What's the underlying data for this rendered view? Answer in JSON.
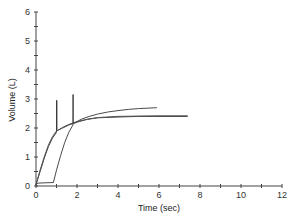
{
  "chart_data": {
    "type": "line",
    "title": "",
    "xlabel": "Time (sec)",
    "ylabel": "Volume (L)",
    "xlim": [
      0,
      12
    ],
    "ylim": [
      0,
      6
    ],
    "x_ticks": [
      0,
      2,
      4,
      6,
      8,
      10,
      12
    ],
    "y_ticks": [
      0,
      1,
      2,
      3,
      4,
      5,
      6
    ],
    "x_minor_step": 1,
    "y_minor_step": 0.5,
    "grid": false,
    "legend": null,
    "series": [
      {
        "name": "curve-1",
        "color": "#3a3a3a",
        "points": [
          [
            0,
            0.05
          ],
          [
            0.2,
            0.5
          ],
          [
            0.4,
            0.95
          ],
          [
            0.6,
            1.35
          ],
          [
            0.8,
            1.65
          ],
          [
            1.0,
            1.85
          ],
          [
            1.0,
            2.95
          ],
          [
            1.02,
            2.95
          ],
          [
            1.02,
            1.9
          ],
          [
            1.3,
            2.02
          ],
          [
            1.6,
            2.12
          ],
          [
            2.0,
            2.22
          ],
          [
            2.5,
            2.3
          ],
          [
            3,
            2.35
          ],
          [
            4,
            2.38
          ],
          [
            5,
            2.4
          ],
          [
            6,
            2.4
          ],
          [
            7.4,
            2.4
          ]
        ]
      },
      {
        "name": "curve-2",
        "color": "#555555",
        "points": [
          [
            0,
            0.05
          ],
          [
            0.2,
            0.55
          ],
          [
            0.4,
            1.0
          ],
          [
            0.6,
            1.4
          ],
          [
            0.8,
            1.7
          ],
          [
            1.0,
            1.9
          ],
          [
            1.3,
            2.0
          ],
          [
            1.6,
            2.1
          ],
          [
            2.0,
            2.2
          ],
          [
            2.5,
            2.3
          ],
          [
            3,
            2.36
          ],
          [
            4,
            2.4
          ],
          [
            5,
            2.41
          ],
          [
            6,
            2.42
          ],
          [
            7.4,
            2.42
          ]
        ]
      },
      {
        "name": "curve-3",
        "color": "#4a4a4a",
        "points": [
          [
            0,
            0.05
          ],
          [
            0.1,
            0.1
          ],
          [
            0.85,
            0.12
          ],
          [
            1.0,
            0.55
          ],
          [
            1.2,
            1.05
          ],
          [
            1.4,
            1.5
          ],
          [
            1.6,
            1.85
          ],
          [
            1.8,
            2.1
          ],
          [
            1.8,
            3.15
          ],
          [
            1.82,
            3.15
          ],
          [
            1.82,
            2.15
          ],
          [
            2.2,
            2.3
          ],
          [
            2.6,
            2.4
          ],
          [
            3,
            2.48
          ],
          [
            3.5,
            2.55
          ],
          [
            4,
            2.6
          ],
          [
            4.5,
            2.64
          ],
          [
            5,
            2.67
          ],
          [
            5.9,
            2.7
          ]
        ]
      }
    ]
  }
}
